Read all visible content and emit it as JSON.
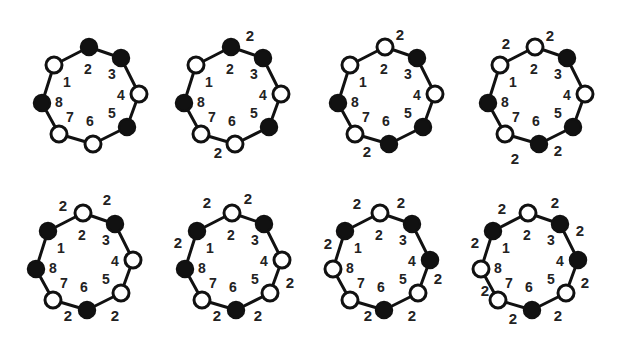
{
  "figure": {
    "colors": {
      "line": "#111111",
      "filled_node": "#111111",
      "open_node": "#ffffff",
      "text": "#222222"
    },
    "site_labels": [
      "1",
      "2",
      "3",
      "4",
      "5",
      "6",
      "7",
      "8"
    ],
    "diagrams": [
      {
        "id": 1,
        "filled": [
          2,
          3,
          5,
          8
        ],
        "open": [
          1,
          4,
          6,
          7
        ],
        "edge_labels": []
      },
      {
        "id": 2,
        "filled": [
          2,
          3,
          5,
          8
        ],
        "open": [
          1,
          4,
          6,
          7
        ],
        "edge_labels": [
          {
            "text": "2",
            "dx": 19,
            "dy": -12
          },
          {
            "text": "2",
            "dx": -13,
            "dy": 105
          }
        ]
      },
      {
        "id": 3,
        "filled": [
          3,
          5,
          6,
          8
        ],
        "open": [
          1,
          2,
          4,
          7
        ],
        "edge_labels": [
          {
            "text": "2",
            "dx": 15,
            "dy": -13
          },
          {
            "text": "2",
            "dx": -18,
            "dy": 104
          }
        ]
      },
      {
        "id": 4,
        "filled": [
          3,
          5,
          6,
          8
        ],
        "open": [
          1,
          2,
          4,
          7
        ],
        "edge_labels": [
          {
            "text": "2",
            "dx": -29,
            "dy": -4
          },
          {
            "text": "2",
            "dx": 15,
            "dy": -12
          },
          {
            "text": "2",
            "dx": -20,
            "dy": 111
          },
          {
            "text": "2",
            "dx": 23,
            "dy": 103
          }
        ]
      },
      {
        "id": 5,
        "filled": [
          1,
          3,
          6,
          8
        ],
        "open": [
          2,
          4,
          5,
          7
        ],
        "edge_labels": [
          {
            "text": "2",
            "dx": -20,
            "dy": -8
          },
          {
            "text": "2",
            "dx": 24,
            "dy": -14
          },
          {
            "text": "2",
            "dx": -15,
            "dy": 102
          },
          {
            "text": "2",
            "dx": 32,
            "dy": 102
          }
        ]
      },
      {
        "id": 6,
        "filled": [
          1,
          3,
          6,
          8
        ],
        "open": [
          2,
          4,
          5,
          7
        ],
        "edge_labels": [
          {
            "text": "2",
            "dx": -25,
            "dy": -11
          },
          {
            "text": "2",
            "dx": 16,
            "dy": -15
          },
          {
            "text": "2",
            "dx": -54,
            "dy": 29
          },
          {
            "text": "2",
            "dx": 58,
            "dy": 69
          },
          {
            "text": "2",
            "dx": -15,
            "dy": 102
          },
          {
            "text": "2",
            "dx": 26,
            "dy": 102
          }
        ]
      },
      {
        "id": 7,
        "filled": [
          1,
          3,
          4,
          6
        ],
        "open": [
          2,
          5,
          7,
          8
        ],
        "edge_labels": [
          {
            "text": "2",
            "dx": -23,
            "dy": -10
          },
          {
            "text": "2",
            "dx": 21,
            "dy": -11
          },
          {
            "text": "2",
            "dx": -52,
            "dy": 30
          },
          {
            "text": "2",
            "dx": 58,
            "dy": 65
          },
          {
            "text": "2",
            "dx": -12,
            "dy": 102
          },
          {
            "text": "2",
            "dx": 32,
            "dy": 102
          }
        ]
      },
      {
        "id": 8,
        "filled": [
          1,
          3,
          4,
          6
        ],
        "open": [
          2,
          5,
          7,
          8
        ],
        "edge_labels": [
          {
            "text": "2",
            "dx": -26,
            "dy": -5
          },
          {
            "text": "2",
            "dx": 27,
            "dy": -11
          },
          {
            "text": "2",
            "dx": 52,
            "dy": 17
          },
          {
            "text": "2",
            "dx": -53,
            "dy": 29
          },
          {
            "text": "2",
            "dx": 57,
            "dy": 69
          },
          {
            "text": "2",
            "dx": -43,
            "dy": 77
          },
          {
            "text": "2",
            "dx": -15,
            "dy": 105
          },
          {
            "text": "2",
            "dx": 30,
            "dy": 102
          }
        ]
      }
    ],
    "layout": {
      "origins": [
        [
          89,
          47
        ],
        [
          231,
          47
        ],
        [
          385,
          47
        ],
        [
          535,
          47
        ],
        [
          83,
          213
        ],
        [
          232,
          213
        ],
        [
          380,
          213
        ],
        [
          528,
          213
        ]
      ],
      "node_offsets": {
        "1": [
          -35,
          18
        ],
        "2": [
          0,
          0
        ],
        "3": [
          32,
          11
        ],
        "4": [
          50,
          47
        ],
        "5": [
          38,
          80
        ],
        "6": [
          4,
          97
        ],
        "7": [
          -30,
          87
        ],
        "8": [
          -47,
          56
        ]
      },
      "index_offsets": {
        "1": [
          -22,
          35
        ],
        "2": [
          -1,
          22
        ],
        "3": [
          23,
          27
        ],
        "4": [
          32,
          48
        ],
        "5": [
          23,
          66
        ],
        "6": [
          1,
          74
        ],
        "7": [
          -19,
          70
        ],
        "8": [
          -30,
          55
        ]
      },
      "node_radius": 8
    }
  }
}
